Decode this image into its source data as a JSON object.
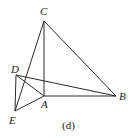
{
  "figure": {
    "caption": "(d)",
    "points": {
      "A": {
        "label": "A",
        "x": 44,
        "y": 96
      },
      "B": {
        "label": "B",
        "x": 116,
        "y": 96
      },
      "C": {
        "label": "C",
        "x": 44,
        "y": 21
      },
      "D": {
        "label": "D",
        "x": 16,
        "y": 75
      },
      "E": {
        "label": "E",
        "x": 15,
        "y": 111
      }
    },
    "segments": [
      [
        "C",
        "A"
      ],
      [
        "C",
        "B"
      ],
      [
        "A",
        "B"
      ],
      [
        "C",
        "E"
      ],
      [
        "D",
        "E"
      ],
      [
        "D",
        "A"
      ],
      [
        "D",
        "B"
      ],
      [
        "E",
        "A"
      ]
    ],
    "colors": {
      "stroke": "#2a2a2a",
      "background": "#ffffff"
    }
  }
}
